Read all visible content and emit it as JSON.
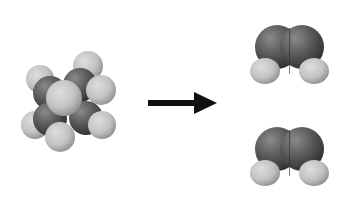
{
  "figure": {
    "type": "reaction-scheme",
    "reactant": {
      "name": "cyclobutane",
      "model": "space-filling",
      "atoms": {
        "carbon": 4,
        "hydrogen": 8
      }
    },
    "arrow": {
      "direction": "right",
      "color": "#111111"
    },
    "products": [
      {
        "name": "ethylene",
        "model": "space-filling",
        "atoms": {
          "carbon": 2,
          "hydrogen": 4
        }
      },
      {
        "name": "ethylene",
        "model": "space-filling",
        "atoms": {
          "carbon": 2,
          "hydrogen": 4
        }
      }
    ],
    "colors": {
      "carbon": "#4a4a4a",
      "hydrogen": "#bdbdbd",
      "background": "#ffffff"
    }
  }
}
